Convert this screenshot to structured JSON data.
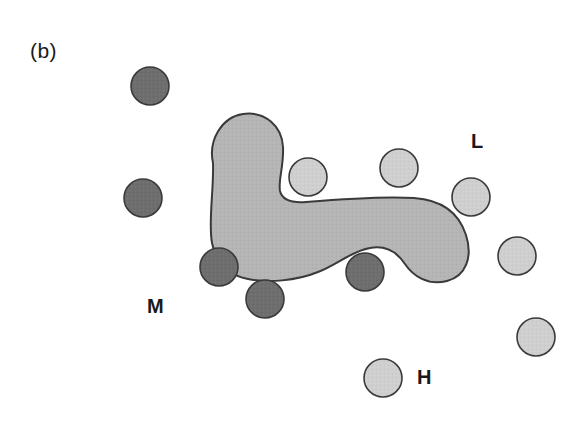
{
  "figure": {
    "panel_label": "(b)",
    "background_color": "#ffffff",
    "width": 585,
    "height": 424
  },
  "labels": [
    {
      "name": "panel-label",
      "text": "(b)",
      "x": 30,
      "y": 40
    },
    {
      "name": "label-L",
      "text": "L",
      "x": 471,
      "y": 131
    },
    {
      "name": "label-M",
      "text": "M",
      "x": 147,
      "y": 296
    },
    {
      "name": "label-H",
      "text": "H",
      "x": 417,
      "y": 367
    }
  ],
  "legend_keys": {
    "L": "light-shaded-circle",
    "M": "dark-shaded-circle",
    "H": "light-shaded-circle"
  },
  "colors": {
    "blob_fill": "#b5b5b5",
    "blob_stroke": "#3a3a3a",
    "dark_circle_fill": "#6e6e6e",
    "light_circle_fill": "#cfcfcf",
    "circle_stroke": "#3a3a3a",
    "text": "#1a1a1a",
    "background": "#ffffff"
  },
  "region": {
    "name": "shaded-region",
    "shape": "irregular-blob",
    "stroke_width": 2,
    "path": "M 213 163 C 208 140, 222 117, 243 114 C 265 111, 282 126, 283 147 C 284 166, 278 180, 280 191 C 282 200, 292 203, 306 202 C 330 200, 380 196, 414 198 C 443 200, 459 213, 466 235 C 473 257, 466 276, 447 281 C 428 286, 413 276, 405 264 C 397 252, 386 245, 370 248 C 352 251, 338 264, 318 272 C 296 281, 268 283, 248 279 C 228 275, 216 262, 212 243 C 208 222, 214 190, 213 163 Z"
  },
  "circles": [
    {
      "name": "circle-dark-1",
      "group": "M",
      "cx": 150,
      "cy": 86,
      "r": 19,
      "shade": "dark"
    },
    {
      "name": "circle-dark-2",
      "group": "M",
      "cx": 143,
      "cy": 198,
      "r": 19,
      "shade": "dark"
    },
    {
      "name": "circle-dark-3",
      "group": "M",
      "cx": 219,
      "cy": 267,
      "r": 19,
      "shade": "dark"
    },
    {
      "name": "circle-dark-4",
      "group": "M",
      "cx": 265,
      "cy": 299,
      "r": 19,
      "shade": "dark"
    },
    {
      "name": "circle-dark-5",
      "group": "M",
      "cx": 365,
      "cy": 272,
      "r": 19,
      "shade": "dark"
    },
    {
      "name": "circle-light-1",
      "group": "L",
      "cx": 308,
      "cy": 177,
      "r": 19,
      "shade": "light"
    },
    {
      "name": "circle-light-2",
      "group": "L",
      "cx": 399,
      "cy": 168,
      "r": 19,
      "shade": "light"
    },
    {
      "name": "circle-light-3",
      "group": "L",
      "cx": 471,
      "cy": 197,
      "r": 19,
      "shade": "light"
    },
    {
      "name": "circle-light-4",
      "group": "L",
      "cx": 517,
      "cy": 256,
      "r": 19,
      "shade": "light"
    },
    {
      "name": "circle-light-5",
      "group": "L",
      "cx": 536,
      "cy": 337,
      "r": 19,
      "shade": "light"
    },
    {
      "name": "circle-light-6",
      "group": "H",
      "cx": 383,
      "cy": 378,
      "r": 19,
      "shade": "light"
    }
  ]
}
